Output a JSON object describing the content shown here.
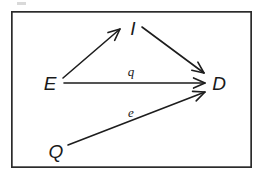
{
  "figure": {
    "kind": "directed-graph",
    "title": "",
    "background_color": "#ffffff",
    "ink_color": "#1d1d1d",
    "frame": {
      "label": "diagram-border",
      "x": 11,
      "y": 11,
      "width": 241,
      "height": 157,
      "stroke_color": "#2b2b2b"
    },
    "nodes": [
      {
        "id": "E",
        "label": "E",
        "x": 50,
        "y": 82,
        "label_anchor": "middle"
      },
      {
        "id": "I",
        "label": "I",
        "x": 133,
        "y": 27,
        "label_anchor": "middle"
      },
      {
        "id": "D",
        "label": "D",
        "x": 219,
        "y": 82,
        "label_anchor": "middle"
      },
      {
        "id": "Q",
        "label": "Q",
        "x": 56,
        "y": 150,
        "label_anchor": "middle"
      }
    ],
    "edges": [
      {
        "id": "E-I",
        "from": "E",
        "to": "I",
        "label": "",
        "x1": 63,
        "y1": 78,
        "x2": 120,
        "y2": 29,
        "directed": true
      },
      {
        "id": "I-D",
        "from": "I",
        "to": "D",
        "label": "",
        "x1": 142,
        "y1": 27,
        "x2": 204,
        "y2": 73,
        "directed": true
      },
      {
        "id": "E-D",
        "from": "E",
        "to": "D",
        "label": "q",
        "label_x": 131,
        "label_y": 76,
        "x1": 64,
        "y1": 83,
        "x2": 205,
        "y2": 83,
        "directed": true
      },
      {
        "id": "Q-D",
        "from": "Q",
        "to": "D",
        "label": "e",
        "label_x": 131,
        "label_y": 117,
        "x1": 68,
        "y1": 145,
        "x2": 205,
        "y2": 92,
        "directed": true
      }
    ]
  }
}
